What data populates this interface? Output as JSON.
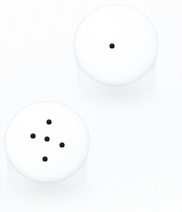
{
  "scene": {
    "title": "Two white dice on a white surface",
    "width": 182,
    "height": 212,
    "background_color": "#ffffff",
    "backdrop_tint": "#fafbfc",
    "view": "top-down oblique",
    "object_count": 2,
    "total_pips": 6
  },
  "palette": {
    "background": "#ffffff",
    "die_face_highlight": "#ffffff",
    "die_face_midtone": "#fbfcfd",
    "die_face_edge": "#eceff3",
    "die_outline": "#dde1e6",
    "die_body": "#e4e7eb",
    "shadow": "#cdd2d8",
    "pip_color": "#000000"
  },
  "dice": [
    {
      "id": "die-top-right",
      "name": "upper-right-die",
      "value": 1,
      "face_label": "one",
      "face": {
        "cx": 116,
        "cy": 45,
        "rx": 42,
        "ry": 40
      },
      "body": {
        "x": 76,
        "y": 52,
        "w": 80,
        "h": 46
      },
      "shadow": {
        "x": 74,
        "y": 74,
        "w": 88,
        "h": 34
      },
      "pips": [
        {
          "name": "pip-center",
          "x": 112,
          "y": 46,
          "d": 5
        }
      ]
    },
    {
      "id": "die-bottom-left",
      "name": "lower-left-die",
      "value": 5,
      "face_label": "five",
      "face": {
        "cx": 47,
        "cy": 142,
        "rx": 42,
        "ry": 40
      },
      "body": {
        "x": 7,
        "y": 150,
        "w": 80,
        "h": 44
      },
      "shadow": {
        "x": 5,
        "y": 170,
        "w": 88,
        "h": 32
      },
      "pips": [
        {
          "name": "pip-top",
          "x": 49,
          "y": 122,
          "d": 5
        },
        {
          "name": "pip-left",
          "x": 33,
          "y": 136,
          "d": 5
        },
        {
          "name": "pip-center",
          "x": 47,
          "y": 139,
          "d": 5
        },
        {
          "name": "pip-right",
          "x": 62,
          "y": 145,
          "d": 5
        },
        {
          "name": "pip-bottom",
          "x": 45,
          "y": 159,
          "d": 5
        }
      ]
    }
  ]
}
